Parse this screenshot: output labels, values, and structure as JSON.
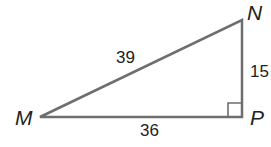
{
  "diagram": {
    "type": "right-triangle",
    "vertices": {
      "M": {
        "label": "M"
      },
      "N": {
        "label": "N"
      },
      "P": {
        "label": "P"
      }
    },
    "sides": {
      "MN": {
        "label": "39"
      },
      "NP": {
        "label": "15"
      },
      "MP": {
        "label": "36"
      }
    },
    "right_angle_at": "P",
    "stroke_color": "#6e6e6e"
  }
}
